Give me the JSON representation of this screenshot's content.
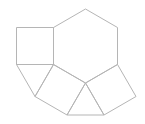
{
  "figure": {
    "background_color": "#ffffff",
    "stroke_color": "#b5b5b5",
    "stroke_width": 1,
    "canvas": {
      "width": 145,
      "height": 124
    },
    "shapes": [
      {
        "name": "hexagon-center",
        "type": "polygon",
        "points": [
          [
            85.5,
            9
          ],
          [
            117.5,
            27.5
          ],
          [
            117.5,
            64.5
          ],
          [
            85.5,
            83
          ],
          [
            53.5,
            64.5
          ],
          [
            53.5,
            27.5
          ]
        ]
      },
      {
        "name": "square-left",
        "type": "polygon",
        "points": [
          [
            16.5,
            27.5
          ],
          [
            53.5,
            27.5
          ],
          [
            53.5,
            64.5
          ],
          [
            16.5,
            64.5
          ]
        ]
      },
      {
        "name": "triangle-lower-left",
        "type": "polygon",
        "points": [
          [
            16.5,
            64.5
          ],
          [
            53.5,
            64.5
          ],
          [
            35,
            96.5
          ]
        ]
      },
      {
        "name": "square-bottom-left",
        "type": "polygon",
        "points": [
          [
            53.5,
            64.5
          ],
          [
            85.5,
            83
          ],
          [
            67,
            115
          ],
          [
            35,
            96.5
          ]
        ]
      },
      {
        "name": "triangle-bottom",
        "type": "polygon",
        "points": [
          [
            67,
            115
          ],
          [
            85.5,
            83
          ],
          [
            104,
            115
          ]
        ]
      },
      {
        "name": "square-bottom-right",
        "type": "polygon",
        "points": [
          [
            85.5,
            83
          ],
          [
            117.5,
            64.5
          ],
          [
            136,
            96.5
          ],
          [
            104,
            115
          ]
        ]
      }
    ]
  }
}
